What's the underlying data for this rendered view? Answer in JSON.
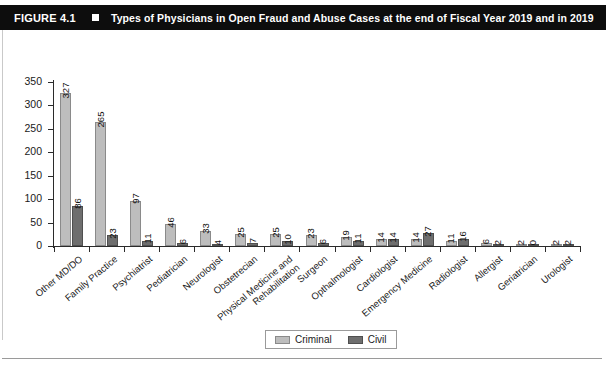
{
  "figure": {
    "number": "FIGURE 4.1",
    "bullet_icon": "square-bullet-icon",
    "title": "Types of Physicians in Open Fraud and Abuse Cases at the end of Fiscal Year 2019 and in 2019"
  },
  "colors": {
    "header_background": "#0d0d0d",
    "header_text": "#ffffff",
    "criminal": "#bdbdbd",
    "civil": "#6e6e6e",
    "axis": "#2b2b2b",
    "page_background": "#ffffff"
  },
  "chart_data": {
    "type": "bar",
    "title": "Types of Physicians in Open Fraud and Abuse Cases at the end of Fiscal Year 2019 and in 2019",
    "xlabel": "",
    "ylabel": "",
    "grid": false,
    "legend_position": "bottom",
    "ylim": [
      0,
      350
    ],
    "yticks": [
      0,
      50,
      100,
      150,
      200,
      250,
      300,
      350
    ],
    "categories": [
      "Other MD/DO",
      "Family Practice",
      "Psychiatrist",
      "Pediatrician",
      "Neurologist",
      "Obstetrecian",
      "Physical Medicine and Rehabilitation",
      "Surgeon",
      "Opthalmologist",
      "Cardiologist",
      "Emergency Medicine",
      "Radiologist",
      "Allergist",
      "Geriatrician",
      "Urologist"
    ],
    "series": [
      {
        "name": "Criminal",
        "color": "#bdbdbd",
        "values": [
          327,
          265,
          97,
          46,
          33,
          25,
          25,
          23,
          19,
          14,
          14,
          11,
          6,
          2,
          2
        ]
      },
      {
        "name": "Civil",
        "color": "#6e6e6e",
        "values": [
          86,
          23,
          11,
          6,
          4,
          7,
          10,
          6,
          11,
          14,
          27,
          16,
          2,
          0,
          2
        ]
      }
    ]
  }
}
